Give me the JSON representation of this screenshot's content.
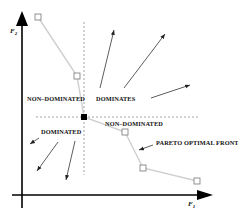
{
  "diagram": {
    "type": "pareto-dominance",
    "axes": {
      "x_label": "F",
      "x_sub": "1",
      "y_label": "F",
      "y_sub": "2"
    },
    "regions": {
      "upper_left": "NON–DOMINATED",
      "upper_right": "DOMINATES",
      "lower_left": "DOMINATED",
      "lower_right": "NON–DOMINATED"
    },
    "annotation": "PARETO OPTIMAL FRONT",
    "pareto_points": [
      {
        "x": 38,
        "y": 17
      },
      {
        "x": 77,
        "y": 76
      },
      {
        "x": 84,
        "y": 117
      },
      {
        "x": 125,
        "y": 132
      },
      {
        "x": 143,
        "y": 168
      },
      {
        "x": 197,
        "y": 181
      }
    ],
    "reference_point": {
      "x": 84,
      "y": 117
    },
    "colors": {
      "axis": "#000000",
      "front_line": "#c8c8c8",
      "marker": "#777777",
      "dashed": "#999999",
      "arrow": "#333333"
    }
  }
}
